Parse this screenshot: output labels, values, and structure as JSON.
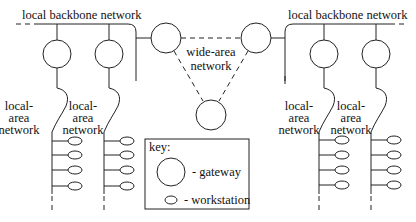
{
  "diagram": {
    "type": "network-topology",
    "labels": {
      "left_backbone": "local backbone network",
      "right_backbone": "local backbone network",
      "wan": [
        "wide-area",
        "network"
      ],
      "lan": [
        "local-",
        "area",
        "network"
      ]
    },
    "key": {
      "title": "key:",
      "gateway": "- gateway",
      "workstation": "- workstation"
    },
    "nodes": {
      "gateways": 7,
      "workstations": 16,
      "lans": 4
    },
    "colors": {
      "stroke": "#222222",
      "background": "#ffffff"
    }
  }
}
